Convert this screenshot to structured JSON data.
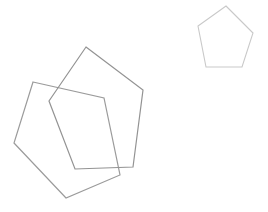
{
  "canvas": {
    "width": 268,
    "height": 212,
    "background": "#ffffff"
  },
  "shapes": [
    {
      "name": "large-pentagon-back",
      "type": "polygon",
      "sides": 5,
      "stroke": "#9b9b9b",
      "stroke_width": 1.2,
      "fill": "none",
      "points": [
        [
          33,
          82
        ],
        [
          104,
          98
        ],
        [
          120,
          175
        ],
        [
          66,
          198
        ],
        [
          14,
          143
        ]
      ]
    },
    {
      "name": "large-pentagon-front",
      "type": "polygon",
      "sides": 5,
      "stroke": "#939393",
      "stroke_width": 1.2,
      "fill": "none",
      "points": [
        [
          86,
          47
        ],
        [
          143,
          90
        ],
        [
          133,
          167
        ],
        [
          75,
          169
        ],
        [
          49,
          101
        ]
      ]
    },
    {
      "name": "small-pentagon",
      "type": "polygon",
      "sides": 5,
      "stroke": "#c9c9c9",
      "stroke_width": 1.1,
      "fill": "none",
      "points": [
        [
          226,
          6
        ],
        [
          253,
          33
        ],
        [
          242,
          67
        ],
        [
          206,
          67
        ],
        [
          198,
          26
        ]
      ]
    }
  ]
}
